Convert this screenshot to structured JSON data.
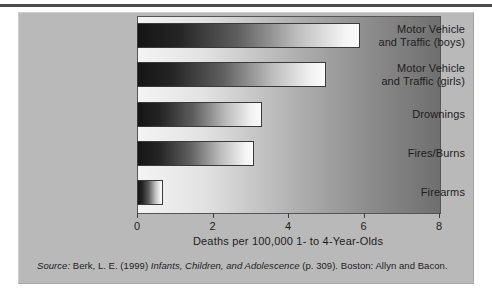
{
  "figure": {
    "panel_color": "#b9b9b9",
    "rule_color": "#4a4a4a"
  },
  "chart_data": {
    "type": "bar",
    "orientation": "horizontal",
    "title": "",
    "categories": [
      "Motor Vehicle\nand Traffic (boys)",
      "Motor Vehicle\nand Traffic (girls)",
      "Drownings",
      "Fires/Burns",
      "Firearms"
    ],
    "values": [
      5.9,
      5.0,
      3.3,
      3.1,
      0.7
    ],
    "xlabel": "Deaths per 100,000 1- to 4-Year-Olds",
    "ylabel": "",
    "xlim": [
      0,
      8
    ],
    "xticks": [
      0,
      2,
      4,
      6,
      8
    ],
    "xtick_labels": [
      "0",
      "2",
      "4",
      "6",
      "8"
    ],
    "grid": false,
    "legend": null,
    "bar_style": "gradient-dark-to-light"
  },
  "source": {
    "prefix": "Source:",
    "author": " Berk, L. E. (1999) ",
    "work": "Infants, Children, and Adolescence",
    "suffix": " (p. 309). Boston: Allyn and Bacon."
  }
}
